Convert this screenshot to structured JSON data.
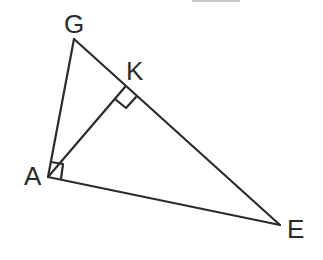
{
  "diagram": {
    "type": "geometry-triangle",
    "stroke_color": "#2b2b2b",
    "points": {
      "G": {
        "label": "G",
        "x": 74,
        "y": 39
      },
      "K": {
        "label": "K",
        "x": 125,
        "y": 87
      },
      "A": {
        "label": "A",
        "x": 48,
        "y": 177
      },
      "E": {
        "label": "E",
        "x": 280,
        "y": 225
      }
    },
    "segments": [
      "GA",
      "GE",
      "AE",
      "AK"
    ],
    "right_angles": [
      "AKE",
      "GAE"
    ]
  },
  "labels": {
    "G": "G",
    "K": "K",
    "A": "A",
    "E": "E"
  }
}
